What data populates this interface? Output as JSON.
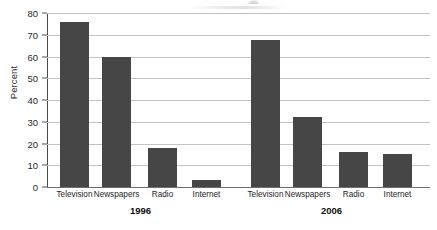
{
  "chart_data": {
    "type": "bar",
    "title": "",
    "subtitle": "",
    "xlabel": "",
    "ylabel": "Percent",
    "ylim": [
      0,
      80
    ],
    "ytick_values": [
      0,
      10,
      20,
      30,
      40,
      50,
      60,
      70,
      80
    ],
    "ytick_labels": [
      "0",
      "10",
      "20",
      "30",
      "40",
      "50",
      "60",
      "70",
      "80"
    ],
    "grid": "horizontal",
    "legend": "none",
    "categories": [
      "Television",
      "Newspapers",
      "Radio",
      "Internet"
    ],
    "groups": [
      {
        "name": "1996",
        "label": "1996",
        "values": [
          76,
          60,
          18,
          3
        ]
      },
      {
        "name": "2006",
        "label": "2006",
        "values": [
          67.5,
          32,
          16,
          15
        ]
      }
    ],
    "series": [
      {
        "name": "1996",
        "values": [
          76,
          60,
          18,
          3
        ]
      },
      {
        "name": "2006",
        "values": [
          67.5,
          32,
          16,
          15
        ]
      }
    ],
    "bar_color": "#464646",
    "grid_color": "#c2c2c2",
    "axis_color": "#4a4a4a",
    "background": "#ffffff"
  }
}
